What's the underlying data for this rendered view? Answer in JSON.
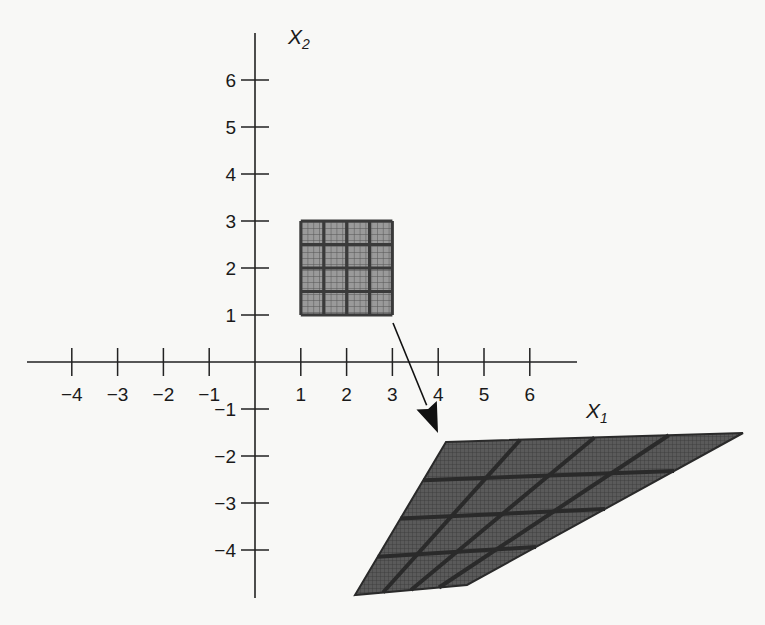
{
  "axes": {
    "x_label": "X",
    "x_label_sub": "1",
    "y_label": "X",
    "y_label_sub": "2",
    "x_ticks": [
      {
        "label": "−4",
        "value": -4
      },
      {
        "label": "−3",
        "value": -3
      },
      {
        "label": "−2",
        "value": -2
      },
      {
        "label": "−1",
        "value": -1
      },
      {
        "label": "1",
        "value": 1
      },
      {
        "label": "2",
        "value": 2
      },
      {
        "label": "3",
        "value": 3
      },
      {
        "label": "4",
        "value": 4
      },
      {
        "label": "5",
        "value": 5
      },
      {
        "label": "6",
        "value": 6
      }
    ],
    "y_ticks": [
      {
        "label": "6",
        "value": 6
      },
      {
        "label": "5",
        "value": 5
      },
      {
        "label": "4",
        "value": 4
      },
      {
        "label": "3",
        "value": 3
      },
      {
        "label": "2",
        "value": 2
      },
      {
        "label": "1",
        "value": 1
      },
      {
        "label": "−1",
        "value": -1
      },
      {
        "label": "−2",
        "value": -2
      },
      {
        "label": "−3",
        "value": -3
      },
      {
        "label": "−4",
        "value": -4
      }
    ]
  },
  "source_region": {
    "x_range": [
      1,
      3
    ],
    "y_range": [
      1,
      3
    ],
    "coarse_divisions": 4,
    "fine_divisions": 4,
    "fill_color": "#8a8a8a",
    "line_color": "#3a3a3a"
  },
  "mapped_region": {
    "corners": {
      "top_left": [
        446,
        442
      ],
      "top_right": [
        743,
        433
      ],
      "bottom_left": [
        355,
        595
      ],
      "bottom_right": [
        467,
        585
      ]
    },
    "coarse_divisions": 4,
    "fill_color": "#4a4a4a",
    "line_color": "#2a2a2a"
  },
  "arrow": {
    "from": [
      393,
      323
    ],
    "to": [
      438,
      433
    ],
    "color": "#111111"
  },
  "colors": {
    "axis": "#222222",
    "background": "#f8f8f6"
  }
}
